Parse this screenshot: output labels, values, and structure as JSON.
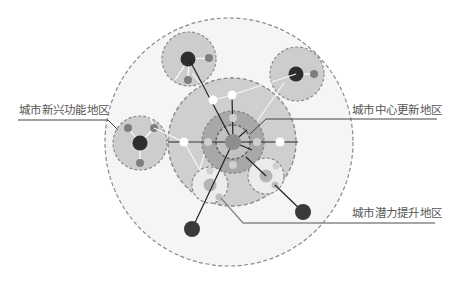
{
  "diagram": {
    "title": "",
    "labels": {
      "emerging": "城市新兴功能地区",
      "center_renewal": "城市中心更新地区",
      "potential_upgrade": "城市潜力提升地区"
    },
    "colors": {
      "outer_zone_fill": "#f4f4f4",
      "middle_zone_fill": "#cfcfcf",
      "core_ring_fill": "#a9a9a9",
      "core_inner_fill": "#c4c4c4",
      "core_dot": "#8e8e8e",
      "satellite_fill": "#cccccc",
      "satellite_light_fill": "#ececec",
      "dark_node": "#333333",
      "mid_node": "#7d7d7d",
      "light_node": "#b5b5b5",
      "white_node": "#ffffff",
      "connector": "#222222",
      "dashed_border": "#8a8a8a",
      "leader_line": "#333333",
      "text": "#555555"
    },
    "zones": [
      {
        "name": "outer-region",
        "cx": 229,
        "cy": 142,
        "r": 124
      },
      {
        "name": "middle-region",
        "cx": 232,
        "cy": 142,
        "r": 64
      },
      {
        "name": "core-ring",
        "cx": 233,
        "cy": 142,
        "r": 31
      },
      {
        "name": "core-inner",
        "cx": 233,
        "cy": 142,
        "r": 17
      }
    ],
    "satellites": [
      {
        "name": "satellite-top-left",
        "cx": 189,
        "cy": 59,
        "r": 27
      },
      {
        "name": "satellite-top-right",
        "cx": 297,
        "cy": 74,
        "r": 27
      },
      {
        "name": "satellite-left",
        "cx": 140,
        "cy": 143,
        "r": 27
      },
      {
        "name": "satellite-bottom-left",
        "cx": 210,
        "cy": 185,
        "r": 18
      },
      {
        "name": "satellite-bottom-right",
        "cx": 266,
        "cy": 176,
        "r": 18
      }
    ]
  }
}
